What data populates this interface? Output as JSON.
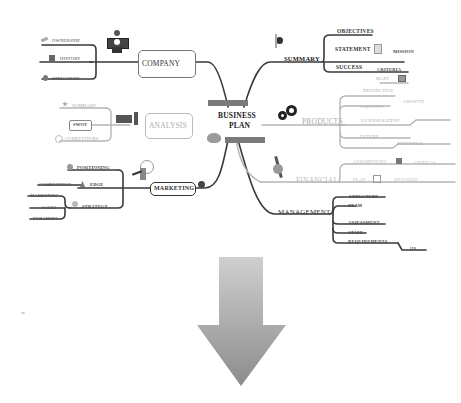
{
  "center": {
    "line1": "BUSINESS",
    "line2": "PLAN"
  },
  "branches": {
    "summary": {
      "label": "SUMMARY",
      "children": [
        {
          "label": "OBJECTIVES"
        },
        {
          "label": "STATEMENT",
          "sub": "MISSION"
        },
        {
          "label": "SUCCESS",
          "sub": "CRITERIA"
        }
      ]
    },
    "company": {
      "label": "COMPANY",
      "children": [
        {
          "label": "OWNERSHIP"
        },
        {
          "label": "HISTORY"
        },
        {
          "label": "STRUCTURE"
        }
      ]
    },
    "analysis": {
      "label": "ANALYSIS",
      "children": [
        {
          "label": "SUMMARY"
        },
        {
          "label": "SWOT"
        },
        {
          "label": "COMPETITORS"
        }
      ]
    },
    "products": {
      "label": "PRODUCTS",
      "children": [
        {
          "label": "MAIN"
        },
        {
          "label": "DISTINCTIVE"
        },
        {
          "label": "CAPACITY",
          "sub": "GROWTH"
        },
        {
          "label": "LICENSE/PATENT"
        },
        {
          "label": "FUTURE",
          "sub": "POTENTIAL"
        }
      ]
    },
    "financial": {
      "label": "FINANCIAL",
      "children": [
        {
          "label": "ASSUMPTIONS",
          "sub": "CRITICAL"
        },
        {
          "label": "PLAN",
          "sub": "DETAILED"
        }
      ]
    },
    "marketing": {
      "label": "MARKETING",
      "children": [
        {
          "label": "POSITIONING"
        },
        {
          "label": "EDGE",
          "sub": "COMPETITIVE"
        },
        {
          "label": "STRATEGY",
          "subs": [
            "MARKETING",
            "SALES",
            "PYRAMIDS"
          ]
        }
      ]
    },
    "management": {
      "label": "MANAGEMENT",
      "children": [
        {
          "label": "STRUCTURE"
        },
        {
          "label": "TEAM"
        },
        {
          "label": "ASSESSMENT"
        },
        {
          "label": "STAFF"
        },
        {
          "label": "REQUIREMENTS",
          "sub": "HR"
        }
      ]
    }
  },
  "arrow": {
    "direction": "down",
    "icon": "arrow-down-icon"
  },
  "colors": {
    "line": "#3a3a3a",
    "faded_line": "#b5b5b5",
    "center_bar": "#7a7a7a",
    "arrow_top": "#c8c8c8",
    "arrow_bottom": "#8a8a8a"
  }
}
